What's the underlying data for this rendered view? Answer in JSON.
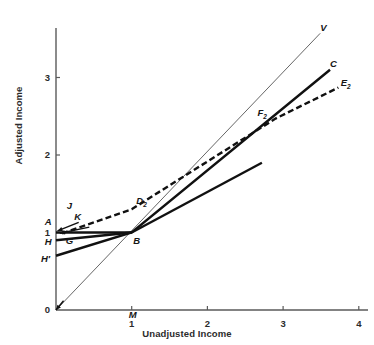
{
  "chart_data": {
    "type": "line",
    "title": "",
    "xlabel": "Unadjusted Income",
    "ylabel": "Adjusted Income",
    "xlim": [
      0,
      4.2
    ],
    "ylim": [
      0,
      3.45
    ],
    "xticks": [
      1,
      2,
      3,
      4
    ],
    "xtick_labels": [
      "1",
      "2",
      "3",
      "4"
    ],
    "yticks": [
      0,
      1,
      2,
      3
    ],
    "ytick_labels": [
      "0",
      "1",
      "2",
      "3"
    ],
    "grid": false,
    "legend": "none",
    "series": [
      {
        "name": "V",
        "style": "thin-solid",
        "points": [
          [
            0,
            0
          ],
          [
            3.49,
            3.57
          ]
        ],
        "note": "45-degree reference ray through origin and B"
      },
      {
        "name": "C",
        "style": "bold-solid",
        "points": [
          [
            0,
            0.7
          ],
          [
            1.0,
            1.0
          ],
          [
            3.62,
            3.1
          ]
        ],
        "note": "kinked schedule H'-B-C"
      },
      {
        "name": "E2",
        "style": "bold-dashed",
        "points": [
          [
            0.08,
            0.99
          ],
          [
            1.0,
            1.3
          ],
          [
            2.9,
            2.47
          ],
          [
            3.73,
            2.87
          ]
        ],
        "note": "dashed schedule A-D2-F2-E2"
      },
      {
        "name": "AB",
        "style": "bold-solid",
        "points": [
          [
            0.0,
            1.0
          ],
          [
            1.0,
            1.0
          ]
        ],
        "note": "horizontal guarantee segment A to B"
      },
      {
        "name": "BG-flat",
        "style": "bold-solid",
        "points": [
          [
            1.0,
            1.0
          ],
          [
            2.72,
            1.9
          ]
        ],
        "note": "flatter bold ray from B"
      },
      {
        "name": "HB",
        "style": "bold-solid",
        "points": [
          [
            0.0,
            0.9
          ],
          [
            1.0,
            1.0
          ]
        ],
        "note": "short bold segment H to B"
      }
    ],
    "point_labels": [
      {
        "text": "V",
        "x": 3.53,
        "y": 3.62
      },
      {
        "text": "C",
        "x": 3.66,
        "y": 3.16
      },
      {
        "text": "E",
        "sub": "2",
        "x": 3.8,
        "y": 2.92
      },
      {
        "text": "F",
        "sub": "2",
        "x": 2.7,
        "y": 2.53
      },
      {
        "text": "D",
        "sub": "2",
        "x": 1.1,
        "y": 1.4
      },
      {
        "text": "J",
        "x": 0.18,
        "y": 1.33
      },
      {
        "text": "K",
        "x": 0.28,
        "y": 1.19
      },
      {
        "text": "A",
        "x": -0.11,
        "y": 1.12
      },
      {
        "text": "G",
        "x": 0.17,
        "y": 0.88
      },
      {
        "text": "H",
        "x": -0.11,
        "y": 0.86
      },
      {
        "text": "H′",
        "x": -0.16,
        "y": 0.64
      },
      {
        "text": "B",
        "x": 1.06,
        "y": 0.88
      },
      {
        "text": "M",
        "x": 1.0,
        "y": -0.08
      }
    ],
    "arrows": [
      {
        "name": "arrow-A-to-axis",
        "from": [
          0.3,
          1.13
        ],
        "to": [
          0.02,
          1.02
        ]
      },
      {
        "name": "arrow-K-to-axis",
        "from": [
          0.44,
          1.07
        ],
        "to": [
          0.05,
          0.99
        ]
      },
      {
        "name": "arrow-origin-tick",
        "from": [
          0.1,
          0.12
        ],
        "to": [
          0.0,
          0.0
        ]
      }
    ],
    "colors": {
      "axis": "#5a5a5a",
      "line": "#111111",
      "thin_line": "#555555",
      "text": "#1a1a1a",
      "background": "#ffffff"
    }
  }
}
